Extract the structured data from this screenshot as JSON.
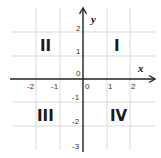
{
  "diagram": {
    "axes": {
      "x": {
        "name": "x",
        "ticks": [
          "-2",
          "-1",
          "0",
          "1",
          "2"
        ]
      },
      "y": {
        "name": "y",
        "ticks": [
          "2",
          "1",
          "0",
          "-1",
          "-2",
          "-3"
        ]
      }
    },
    "quadrants": {
      "q1": "I",
      "q2": "II",
      "q3": "III",
      "q4": "IV"
    },
    "colors": {
      "axis": "#222222",
      "grid": "#d9d9d9",
      "text": "#1a1a1a"
    }
  }
}
